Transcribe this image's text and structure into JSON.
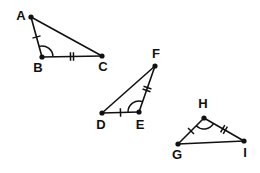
{
  "figure": {
    "background_color": "#ffffff",
    "stroke_color": "#111111",
    "label_color": "#111111",
    "triangles": [
      {
        "name": "triangle-abc",
        "vertices": [
          {
            "label": "A",
            "x": 31,
            "y": 17,
            "label_x": 21,
            "label_y": 17
          },
          {
            "label": "B",
            "x": 42,
            "y": 57,
            "label_x": 38,
            "label_y": 69
          },
          {
            "label": "C",
            "x": 102,
            "y": 56,
            "label_x": 103,
            "label_y": 68
          }
        ],
        "edges": [
          {
            "name": "edge-ab",
            "from": "A",
            "to": "B",
            "ticks": 1
          },
          {
            "name": "edge-bc",
            "from": "B",
            "to": "C",
            "ticks": 2
          },
          {
            "name": "edge-ac",
            "from": "A",
            "to": "C",
            "ticks": 0
          }
        ],
        "angle_mark": {
          "at": "B",
          "arcs": 1
        }
      },
      {
        "name": "triangle-def",
        "vertices": [
          {
            "label": "D",
            "x": 102,
            "y": 113,
            "label_x": 101,
            "label_y": 126
          },
          {
            "label": "E",
            "x": 139,
            "y": 112,
            "label_x": 140,
            "label_y": 126
          },
          {
            "label": "F",
            "x": 155,
            "y": 66,
            "label_x": 156,
            "label_y": 55
          }
        ],
        "edges": [
          {
            "name": "edge-de",
            "from": "D",
            "to": "E",
            "ticks": 1
          },
          {
            "name": "edge-ef",
            "from": "E",
            "to": "F",
            "ticks": 2
          },
          {
            "name": "edge-df",
            "from": "D",
            "to": "F",
            "ticks": 0
          }
        ],
        "angle_mark": {
          "at": "E",
          "arcs": 1
        }
      },
      {
        "name": "triangle-ghi",
        "vertices": [
          {
            "label": "G",
            "x": 178,
            "y": 144,
            "label_x": 177,
            "label_y": 156
          },
          {
            "label": "H",
            "x": 204,
            "y": 118,
            "label_x": 203,
            "label_y": 105
          },
          {
            "label": "I",
            "x": 244,
            "y": 141,
            "label_x": 245,
            "label_y": 154
          }
        ],
        "edges": [
          {
            "name": "edge-gh",
            "from": "G",
            "to": "H",
            "ticks": 1
          },
          {
            "name": "edge-hi",
            "from": "H",
            "to": "I",
            "ticks": 2
          },
          {
            "name": "edge-gi",
            "from": "G",
            "to": "I",
            "ticks": 0
          }
        ],
        "angle_mark": {
          "at": "H",
          "arcs": 1
        }
      }
    ]
  }
}
